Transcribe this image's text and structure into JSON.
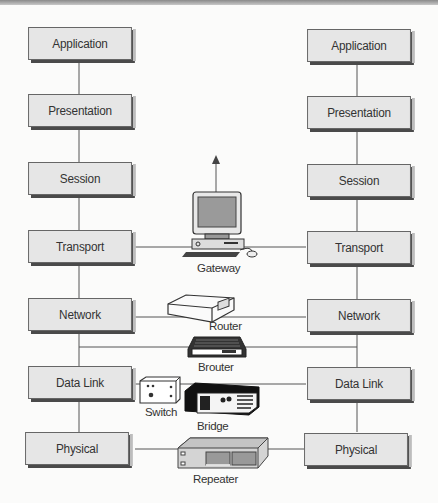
{
  "diagram": {
    "title": "",
    "left_stack": {
      "layers": [
        "Application",
        "Presentation",
        "Session",
        "Transport",
        "Network",
        "Data Link",
        "Physical"
      ]
    },
    "right_stack": {
      "layers": [
        "Application",
        "Presentation",
        "Session",
        "Transport",
        "Network",
        "Data Link",
        "Physical"
      ]
    },
    "devices": [
      {
        "name": "Gateway",
        "connects_layer": "Transport",
        "icon": "computer-icon"
      },
      {
        "name": "Router",
        "connects_layer": "Network",
        "icon": "router-icon"
      },
      {
        "name": "Brouter",
        "connects_layer": "Network/Data Link",
        "icon": "brouter-icon"
      },
      {
        "name": "Switch",
        "connects_layer": "Data Link",
        "icon": "switch-icon"
      },
      {
        "name": "Bridge",
        "connects_layer": "Data Link",
        "icon": "bridge-icon"
      },
      {
        "name": "Repeater",
        "connects_layer": "Physical",
        "icon": "repeater-icon"
      }
    ]
  }
}
